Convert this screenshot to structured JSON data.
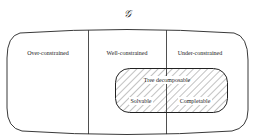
{
  "diagram": {
    "title": "𝒢",
    "regions": [
      {
        "label": "Over-constrained"
      },
      {
        "label": "Well-constrained"
      },
      {
        "label": "Under-constrained"
      }
    ],
    "inner_set": {
      "label": "Tree decomposable",
      "left_label": "Solvable",
      "right_label": "Completable"
    },
    "colors": {
      "stroke": "#222222",
      "background": "#ffffff"
    }
  }
}
